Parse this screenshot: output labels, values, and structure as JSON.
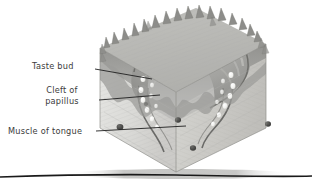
{
  "figure": {
    "style": "grayscale cut-away block diagram",
    "background_color": "#ffffff",
    "label_color": "#3b3b3b",
    "leader_color": "#1f1f1f"
  },
  "labels": [
    {
      "id": "taste-bud",
      "text": "Taste bud",
      "lines": [
        "Taste bud"
      ]
    },
    {
      "id": "cleft-of-papilla",
      "text": "Cleft of papillus",
      "lines": [
        "Cleft of",
        "papillus"
      ]
    },
    {
      "id": "muscle-of-tongue",
      "text": "Muscle of tongue",
      "lines": [
        "Muscle of tongue"
      ]
    }
  ],
  "leaders": [
    {
      "id": "leader-taste-bud",
      "from": [
        95,
        69
      ],
      "to": [
        152,
        79
      ]
    },
    {
      "id": "leader-cleft-of-papilla",
      "from": [
        99,
        100
      ],
      "to": [
        160,
        95
      ]
    },
    {
      "id": "leader-muscle-of-tongue",
      "from": [
        96,
        131
      ],
      "to": [
        186,
        126
      ]
    }
  ],
  "palette": {
    "block_face_left": "#d9d9d6",
    "block_face_right": "#cfcfcb",
    "block_top": "#bdbdb9",
    "epithelium": "#9a9a97",
    "epithelium_dark": "#7e7e7b",
    "papilla_core": "#a8a8a5",
    "cleft_line": "#5f5f5d",
    "taste_bud": "#f2f2ef",
    "muscle_spot": "#4a4a48",
    "ground_line": "#1a1a1a",
    "shadow": "#b9b9b6"
  },
  "counts": {
    "taste_buds_visible": 18,
    "muscle_fiber_spots": 5,
    "papilla_spikes": 22
  }
}
